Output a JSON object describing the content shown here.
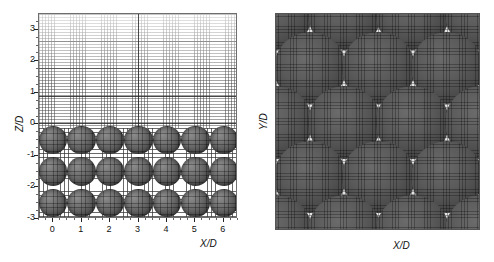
{
  "figure": {
    "type": "two-panel-mesh-visualization",
    "background_color": "#ffffff"
  },
  "chart_data": [
    {
      "type": "scatter",
      "panel": "left",
      "title": "",
      "xlabel": "X/D",
      "ylabel": "Z/D",
      "xlim": [
        -0.5,
        6.5
      ],
      "ylim": [
        -3.0,
        3.5
      ],
      "xticks": [
        0,
        1,
        2,
        3,
        4,
        5,
        6
      ],
      "xticklabels": [
        "0",
        "1",
        "2",
        "3",
        "4",
        "5",
        "6"
      ],
      "yticks": [
        3,
        2,
        1,
        0,
        -1,
        -2,
        -3
      ],
      "yticklabels": [
        "3",
        "2",
        "1",
        "0",
        "-1",
        "-2",
        "-3"
      ],
      "grid": true,
      "legend": null,
      "description": "Side view of a structured computational mesh over a packed bed of spheres; fluid region above z/D = 0 with fine vertical grid lines, packed sphere region below.",
      "series": [
        {
          "name": "sphere centers",
          "marker": "sphere",
          "diameter_in_D": 1.0,
          "x": [
            0,
            1,
            2,
            3,
            4,
            5,
            6,
            0,
            1,
            2,
            3,
            4,
            5,
            6,
            0,
            1,
            2,
            3,
            4,
            5,
            6
          ],
          "y": [
            -0.5,
            -0.5,
            -0.5,
            -0.5,
            -0.5,
            -0.5,
            -0.5,
            -1.5,
            -1.5,
            -1.5,
            -1.5,
            -1.5,
            -1.5,
            -1.5,
            -2.5,
            -2.5,
            -2.5,
            -2.5,
            -2.5,
            -2.5,
            -2.5
          ]
        }
      ]
    },
    {
      "type": "scatter",
      "panel": "right",
      "title": "",
      "xlabel": "X/D",
      "ylabel": "Y/D",
      "xlim": [
        0,
        3
      ],
      "ylim": [
        0,
        3
      ],
      "xticks": [],
      "xticklabels": [],
      "yticks": [],
      "yticklabels": [],
      "grid": true,
      "legend": null,
      "description": "Top view of the same packed bed showing a staggered (offset) square lattice of spheres with fine Cartesian mesh in the interstitial gaps.",
      "series": [
        {
          "name": "sphere centers",
          "marker": "circle",
          "diameter_in_D": 1.0,
          "x": [
            0.0,
            1.0,
            2.0,
            3.0,
            0.5,
            1.5,
            2.5,
            0.0,
            1.0,
            2.0,
            3.0,
            0.5,
            1.5,
            2.5,
            0.0,
            1.0,
            2.0,
            3.0
          ],
          "y": [
            3.0,
            3.0,
            3.0,
            3.0,
            2.25,
            2.25,
            2.25,
            1.5,
            1.5,
            1.5,
            1.5,
            0.75,
            0.75,
            0.75,
            0.0,
            0.0,
            0.0,
            0.0
          ]
        }
      ]
    }
  ],
  "left_panel": {
    "x_axis_title": "X/D",
    "y_axis_title": "Z/D",
    "x_tick_labels": [
      "0",
      "1",
      "2",
      "3",
      "4",
      "5",
      "6"
    ],
    "y_tick_labels": [
      "3",
      "2",
      "1",
      "0",
      "-1",
      "-2",
      "-3"
    ]
  },
  "right_panel": {
    "x_axis_title": "X/D",
    "y_axis_title": "Y/D",
    "x_tick_labels": [],
    "y_tick_labels": []
  },
  "colors": {
    "sphere_dark": "#3d3d3d",
    "sphere_light": "#8c8c8c",
    "mesh_line": "#5a5a5a",
    "axis_line": "#222222",
    "background": "#ffffff",
    "interstitial_mesh": "#e3e3e3"
  }
}
